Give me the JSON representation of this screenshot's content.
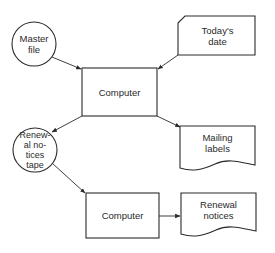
{
  "diagram": {
    "type": "flowchart",
    "nodes": [
      {
        "id": "master-file",
        "shape": "circle",
        "label_lines": [
          "Master",
          "file"
        ]
      },
      {
        "id": "todays-date",
        "shape": "punched-card",
        "label_lines": [
          "Today's",
          "date"
        ]
      },
      {
        "id": "computer-1",
        "shape": "rectangle",
        "label_lines": [
          "Computer"
        ]
      },
      {
        "id": "renewal-notices-tape",
        "shape": "circle",
        "label_lines": [
          "Renew-",
          "al no-",
          "tices",
          "tape"
        ]
      },
      {
        "id": "mailing-labels",
        "shape": "document",
        "label_lines": [
          "Mailing",
          "labels"
        ]
      },
      {
        "id": "computer-2",
        "shape": "rectangle",
        "label_lines": [
          "Computer"
        ]
      },
      {
        "id": "renewal-notices",
        "shape": "document",
        "label_lines": [
          "Renewal",
          "notices"
        ]
      }
    ],
    "edges": [
      {
        "from": "master-file",
        "to": "computer-1"
      },
      {
        "from": "todays-date",
        "to": "computer-1"
      },
      {
        "from": "computer-1",
        "to": "renewal-notices-tape"
      },
      {
        "from": "computer-1",
        "to": "mailing-labels"
      },
      {
        "from": "renewal-notices-tape",
        "to": "computer-2"
      },
      {
        "from": "computer-2",
        "to": "renewal-notices"
      }
    ]
  },
  "labels": {
    "master_file_1": "Master",
    "master_file_2": "file",
    "todays_date_1": "Today's",
    "todays_date_2": "date",
    "computer_1": "Computer",
    "tape_1": "Renew-",
    "tape_2": "al no-",
    "tape_3": "tices",
    "tape_4": "tape",
    "mailing_1": "Mailing",
    "mailing_2": "labels",
    "computer_2": "Computer",
    "notices_1": "Renewal",
    "notices_2": "notices"
  },
  "colors": {
    "line": "#2a2a2a",
    "background": "#ffffff"
  }
}
